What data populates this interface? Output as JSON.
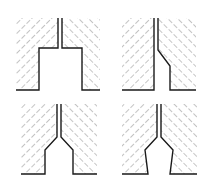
{
  "diagram": {
    "type": "cross-section nozzle/orifice profiles",
    "layout": "2x2 grid",
    "colors": {
      "outline": "#1a1a1a",
      "hatch": "#8a8a8a",
      "background": "#ffffff"
    },
    "panels": [
      {
        "id": "top-left",
        "shape": "rectangular-step orifice",
        "label": ""
      },
      {
        "id": "top-right",
        "shape": "one-sided chamfer step",
        "label": ""
      },
      {
        "id": "bottom-left",
        "shape": "symmetric chamfer with straight bore",
        "label": ""
      },
      {
        "id": "bottom-right",
        "shape": "symmetric chamfer with tapered bore",
        "label": ""
      }
    ]
  }
}
